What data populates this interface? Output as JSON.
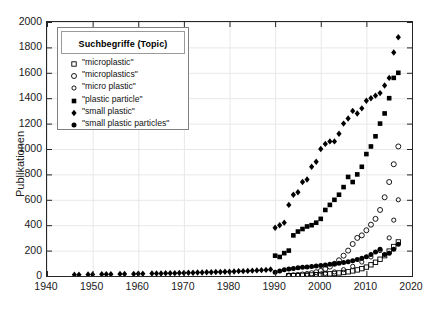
{
  "axis": {
    "ylabel": "Publikationen",
    "yticks": [
      "0",
      "200",
      "400",
      "600",
      "800",
      "1000",
      "1200",
      "1400",
      "1600",
      "1800",
      "2000"
    ],
    "xticks": [
      "1940",
      "1950",
      "1960",
      "1970",
      "1980",
      "1990",
      "2000",
      "2010",
      "2020"
    ]
  },
  "legend": {
    "title": "Suchbegriffe (Topic)",
    "entries": [
      {
        "label": "\"microplastic\"",
        "marker": "open-square"
      },
      {
        "label": "\"microplastics\"",
        "marker": "open-circle"
      },
      {
        "label": "\"micro plastic\"",
        "marker": "open-circle-small"
      },
      {
        "label": "\"plastic particle\"",
        "marker": "filled-square"
      },
      {
        "label": "\"small plastic\"",
        "marker": "filled-diamond"
      },
      {
        "label": "\"small plastic particles\"",
        "marker": "filled-circle"
      }
    ]
  },
  "chart_data": {
    "type": "scatter",
    "title": "",
    "xlabel": "",
    "ylabel": "Publikationen",
    "xlim": [
      1940,
      2020
    ],
    "ylim": [
      0,
      2000
    ],
    "xtick_step": 10,
    "ytick_step": 200,
    "grid": true,
    "legend_position": "top-left",
    "colors": {
      "marker": "#000000",
      "grid": "#e8e8e8",
      "axis": "#262626"
    },
    "series": [
      {
        "name": "\"microplastic\"",
        "marker": "open-square",
        "x": [
          1993,
          1994,
          1995,
          1996,
          1997,
          1998,
          1999,
          2000,
          2001,
          2002,
          2003,
          2004,
          2005,
          2006,
          2007,
          2008,
          2009,
          2010,
          2011,
          2012,
          2013,
          2014,
          2015,
          2016,
          2017
        ],
        "y": [
          2,
          3,
          4,
          5,
          6,
          8,
          10,
          12,
          14,
          17,
          20,
          24,
          28,
          33,
          40,
          48,
          58,
          70,
          88,
          108,
          132,
          160,
          196,
          232,
          268
        ]
      },
      {
        "name": "\"microplastics\"",
        "marker": "open-circle",
        "x": [
          1993,
          1994,
          1995,
          1996,
          1997,
          1998,
          1999,
          2000,
          2001,
          2002,
          2003,
          2004,
          2005,
          2006,
          2007,
          2008,
          2009,
          2010,
          2011,
          2012,
          2013,
          2014,
          2015,
          2016,
          2017
        ],
        "y": [
          4,
          6,
          8,
          12,
          16,
          22,
          30,
          40,
          56,
          74,
          96,
          124,
          160,
          200,
          252,
          300,
          320,
          360,
          404,
          450,
          520,
          620,
          740,
          880,
          1020
        ]
      },
      {
        "name": "\"micro plastic\"",
        "marker": "open-circle-small",
        "x": [
          1993,
          1995,
          1997,
          1999,
          2001,
          2003,
          2005,
          2007,
          2009,
          2011,
          2013,
          2015,
          2016,
          2017
        ],
        "y": [
          2,
          4,
          7,
          12,
          20,
          32,
          50,
          76,
          110,
          150,
          200,
          300,
          440,
          600
        ]
      },
      {
        "name": "\"plastic particle\"",
        "marker": "filled-square",
        "x": [
          1990,
          1991,
          1992,
          1993,
          1994,
          1995,
          1996,
          1997,
          1998,
          1999,
          2000,
          2001,
          2002,
          2003,
          2004,
          2005,
          2006,
          2007,
          2008,
          2009,
          2010,
          2011,
          2012,
          2013,
          2014,
          2015,
          2016,
          2017
        ],
        "y": [
          160,
          150,
          180,
          200,
          320,
          350,
          370,
          390,
          400,
          420,
          450,
          520,
          560,
          600,
          640,
          700,
          780,
          740,
          800,
          860,
          960,
          1020,
          1100,
          1200,
          1280,
          1400,
          1560,
          1600
        ]
      },
      {
        "name": "\"small plastic\"",
        "marker": "filled-diamond",
        "x": [
          1946,
          1947,
          1949,
          1950,
          1952,
          1953,
          1954,
          1956,
          1957,
          1959,
          1960,
          1961,
          1963,
          1964,
          1965,
          1966,
          1967,
          1968,
          1969,
          1970,
          1971,
          1972,
          1973,
          1974,
          1975,
          1976,
          1977,
          1978,
          1979,
          1980,
          1981,
          1982,
          1983,
          1984,
          1985,
          1986,
          1987,
          1988,
          1989,
          1990,
          1991,
          1992,
          1993,
          1994,
          1995,
          1996,
          1997,
          1998,
          1999,
          2000,
          2001,
          2002,
          2003,
          2004,
          2005,
          2006,
          2007,
          2008,
          2009,
          2010,
          2011,
          2012,
          2013,
          2014,
          2015,
          2016,
          2017
        ],
        "y": [
          10,
          10,
          12,
          12,
          14,
          14,
          14,
          16,
          16,
          16,
          18,
          18,
          20,
          20,
          20,
          22,
          22,
          22,
          24,
          24,
          26,
          26,
          28,
          28,
          30,
          30,
          32,
          32,
          34,
          34,
          36,
          38,
          38,
          40,
          42,
          44,
          46,
          48,
          52,
          380,
          400,
          420,
          560,
          640,
          660,
          740,
          760,
          860,
          900,
          1000,
          1040,
          1060,
          1060,
          1120,
          1200,
          1240,
          1300,
          1280,
          1320,
          1380,
          1400,
          1420,
          1440,
          1500,
          1560,
          1760,
          1880
        ]
      },
      {
        "name": "\"small plastic particles\"",
        "marker": "filled-circle",
        "x": [
          1990,
          1991,
          1992,
          1993,
          1994,
          1995,
          1996,
          1997,
          1998,
          1999,
          2000,
          2001,
          2002,
          2003,
          2004,
          2005,
          2006,
          2007,
          2008,
          2009,
          2010,
          2011,
          2012,
          2013,
          2014,
          2015,
          2016,
          2017
        ],
        "y": [
          30,
          40,
          50,
          56,
          60,
          64,
          68,
          70,
          74,
          78,
          82,
          86,
          92,
          96,
          100,
          106,
          112,
          120,
          130,
          140,
          152,
          170,
          188,
          210,
          170,
          180,
          210,
          250
        ]
      }
    ]
  }
}
